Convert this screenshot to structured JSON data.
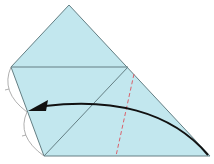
{
  "diagram": {
    "type": "origami-fold-step",
    "colors": {
      "paper_fill": "#c2e7ee",
      "edge": "#647f84",
      "valley_fold": "#d9616b",
      "arrow": "#111111",
      "measure_arc": "#9a9a9a"
    },
    "shape": {
      "vertices": [
        [
          69,
          5
        ],
        [
          11,
          67
        ],
        [
          44,
          156
        ],
        [
          210,
          156
        ]
      ]
    },
    "crease_lines": [
      {
        "name": "horizontal-crease",
        "from": [
          11,
          67
        ],
        "to": [
          128,
          67
        ]
      },
      {
        "name": "diagonal-crease",
        "from": [
          44,
          156
        ],
        "to": [
          128,
          67
        ]
      }
    ],
    "fold_line": {
      "style": "dashed",
      "from": [
        134,
        74
      ],
      "to": [
        116,
        156
      ]
    },
    "arrow": {
      "from": [
        208,
        155
      ],
      "to": [
        28,
        111
      ],
      "direction": "left"
    },
    "equal_segments": [
      {
        "from": [
          11,
          67
        ],
        "to": [
          27,
          112
        ]
      },
      {
        "from": [
          27,
          112
        ],
        "to": [
          44,
          156
        ]
      }
    ]
  }
}
